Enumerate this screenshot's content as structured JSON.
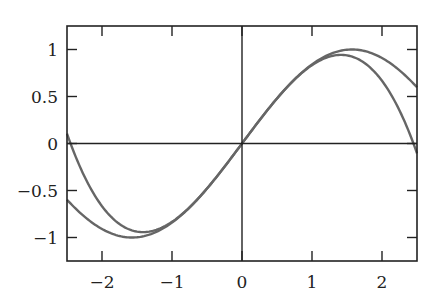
{
  "chart_data": {
    "type": "line",
    "title": "",
    "xlabel": "",
    "ylabel": "",
    "xlim": [
      -2.5,
      2.5
    ],
    "ylim": [
      -1.25,
      1.25
    ],
    "grid": false,
    "legend": null,
    "x_ticks": [
      -2,
      -1,
      0,
      1,
      2
    ],
    "x_tick_labels": [
      "−2",
      "−1",
      "0",
      "1",
      "2"
    ],
    "y_ticks": [
      1,
      0.5,
      0,
      -0.5,
      -1
    ],
    "y_tick_labels": [
      "1",
      "0.5",
      "0",
      "−0.5",
      "−1"
    ],
    "reference_lines": {
      "x0_vertical": true,
      "y0_horizontal": true
    },
    "series": [
      {
        "name": "sin(x)",
        "expression": "sin(x)",
        "color": "#666666",
        "x": [
          -2.5,
          -2.0,
          -1.5708,
          -1.0,
          -0.5,
          0.0,
          0.5,
          1.0,
          1.5708,
          2.0,
          2.5
        ],
        "values": [
          -0.598,
          -0.909,
          -1.0,
          -0.841,
          -0.479,
          0.0,
          0.479,
          0.841,
          1.0,
          0.909,
          0.598
        ]
      },
      {
        "name": "x - x^3/6",
        "expression": "x - x^3/6",
        "color": "#666666",
        "x": [
          -2.5,
          -2.0,
          -1.4142,
          -1.0,
          -0.5,
          0.0,
          0.5,
          1.0,
          1.4142,
          2.0,
          2.5
        ],
        "values": [
          0.104,
          -0.667,
          -0.943,
          -0.833,
          -0.479,
          0.0,
          0.479,
          0.833,
          0.943,
          0.667,
          -0.104
        ]
      }
    ]
  },
  "colors": {
    "axis": "#222222",
    "curve": "#666666",
    "background": "#ffffff"
  }
}
